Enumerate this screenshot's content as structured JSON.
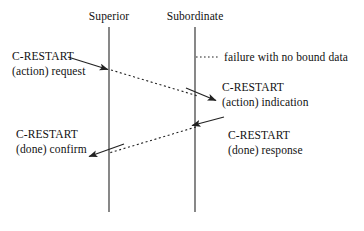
{
  "diagram": {
    "background_color": "#ffffff",
    "line_color": "#222222",
    "text_color": "#111111",
    "lifelines": [
      {
        "name": "superior",
        "label": "Superior",
        "x": 109,
        "top": 27,
        "bottom": 212
      },
      {
        "name": "subordinate",
        "label": "Subordinate",
        "x": 195,
        "top": 27,
        "bottom": 212
      }
    ],
    "messages": [
      {
        "name": "action-request",
        "line1": "C-RESTART",
        "line2": "(action) request",
        "side": "left",
        "arrow": {
          "x1": 68,
          "y1": 57,
          "x2": 110,
          "y2": 70,
          "style": "solid",
          "head": "end"
        }
      },
      {
        "name": "action-indication",
        "line1": "C-RESTART",
        "line2": "(action) indication",
        "side": "right",
        "arrow": {
          "x1": 186,
          "y1": 88,
          "x2": 218,
          "y2": 101,
          "style": "solid",
          "head": "end"
        }
      },
      {
        "name": "done-confirm",
        "line1": "C-RESTART",
        "line2": "(done) confirm",
        "side": "left",
        "arrow": {
          "x1": 124,
          "y1": 144,
          "x2": 87,
          "y2": 157,
          "style": "solid",
          "head": "end"
        }
      },
      {
        "name": "done-response",
        "line1": "C-RESTART",
        "line2": "(done) response",
        "side": "right",
        "arrow": {
          "x1": 224,
          "y1": 117,
          "x2": 190,
          "y2": 126,
          "style": "solid",
          "head": "end"
        }
      }
    ],
    "propagations": [
      {
        "name": "request-propagation",
        "x1": 111,
        "y1": 70,
        "x2": 198,
        "y2": 96,
        "style": "dashed"
      },
      {
        "name": "response-propagation",
        "x1": 196,
        "y1": 127,
        "x2": 109,
        "y2": 153,
        "style": "dashed"
      }
    ],
    "legend": {
      "name": "failure-legend",
      "text": "failure with no bound data",
      "marker": {
        "x1": 196,
        "y1": 57,
        "x2": 219,
        "y2": 57,
        "style": "dotted"
      },
      "text_x": 224,
      "text_y": 50
    }
  }
}
